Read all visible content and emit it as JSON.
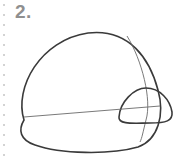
{
  "step": {
    "label": "2."
  },
  "colors": {
    "stroke_main": "#3a3a3a",
    "stroke_guide": "#6a6a6a",
    "step_number": "#8f8f8f",
    "dots": "#c4c4c4"
  },
  "drawing": {
    "subject": "sketch-step",
    "shapes": [
      "large-dome-outline",
      "small-dome-outline",
      "horizontal-guide-line",
      "vertical-guide-curve"
    ]
  }
}
